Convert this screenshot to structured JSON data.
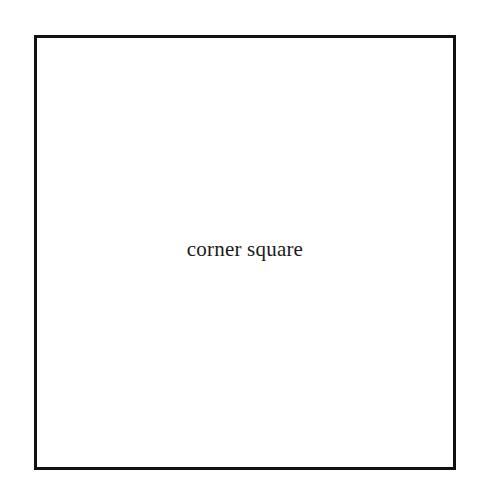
{
  "square": {
    "label": "corner square",
    "border_color": "#111111",
    "background": "#ffffff"
  }
}
